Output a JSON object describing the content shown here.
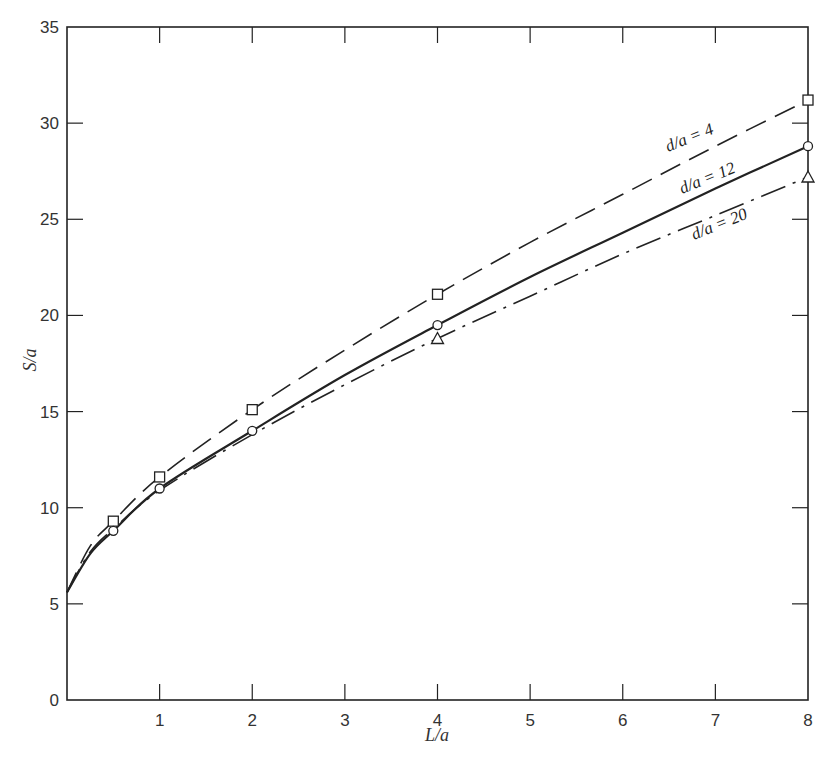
{
  "chart_data": {
    "type": "line",
    "title": "",
    "xlabel": "L/a",
    "ylabel": "S/a",
    "xlim": [
      0,
      8
    ],
    "ylim": [
      0,
      35
    ],
    "grid": false,
    "legend_position": "inline labels on curves (upper right)",
    "x_ticks": [
      1,
      2,
      3,
      4,
      5,
      6,
      7,
      8
    ],
    "y_ticks": [
      0,
      5,
      10,
      15,
      20,
      25,
      30,
      35
    ],
    "series": [
      {
        "name": "d/a = 4",
        "line_style": "dashed",
        "marker": "square",
        "curve_x": [
          0,
          0.25,
          0.5,
          1,
          2,
          3,
          4,
          5,
          6,
          7,
          8
        ],
        "curve_y": [
          5.6,
          8.0,
          9.3,
          11.6,
          15.1,
          18.2,
          21.1,
          23.8,
          26.3,
          28.8,
          31.2
        ],
        "points": [
          {
            "x": 0.5,
            "y": 9.3
          },
          {
            "x": 1,
            "y": 11.6
          },
          {
            "x": 2,
            "y": 15.1
          },
          {
            "x": 4,
            "y": 21.1
          },
          {
            "x": 8,
            "y": 31.2
          }
        ]
      },
      {
        "name": "d/a = 12",
        "line_style": "solid",
        "marker": "circle",
        "curve_x": [
          0,
          0.25,
          0.5,
          1,
          2,
          3,
          4,
          5,
          6,
          7,
          8
        ],
        "curve_y": [
          5.6,
          7.6,
          8.8,
          11.0,
          14.0,
          16.9,
          19.5,
          22.0,
          24.3,
          26.6,
          28.8
        ],
        "points": [
          {
            "x": 0.5,
            "y": 8.8
          },
          {
            "x": 1,
            "y": 11.0
          },
          {
            "x": 2,
            "y": 14.0
          },
          {
            "x": 4,
            "y": 19.5
          },
          {
            "x": 8,
            "y": 28.8
          }
        ]
      },
      {
        "name": "d/a = 20",
        "line_style": "dash-dot",
        "marker": "triangle",
        "curve_x": [
          0,
          0.25,
          0.5,
          1,
          2,
          3,
          4,
          5,
          6,
          7,
          8
        ],
        "curve_y": [
          5.6,
          7.7,
          8.9,
          10.9,
          13.8,
          16.4,
          18.8,
          21.0,
          23.2,
          25.2,
          27.2
        ],
        "points": [
          {
            "x": 4,
            "y": 18.8
          },
          {
            "x": 8,
            "y": 27.2
          }
        ]
      }
    ]
  },
  "labels": {
    "xlabel": "L/a",
    "ylabel": "S/a",
    "series_4": "d/a = 4",
    "series_12": "d/a = 12",
    "series_20": "d/a = 20"
  },
  "colors": {
    "ink": "#222222",
    "background": "#ffffff"
  }
}
